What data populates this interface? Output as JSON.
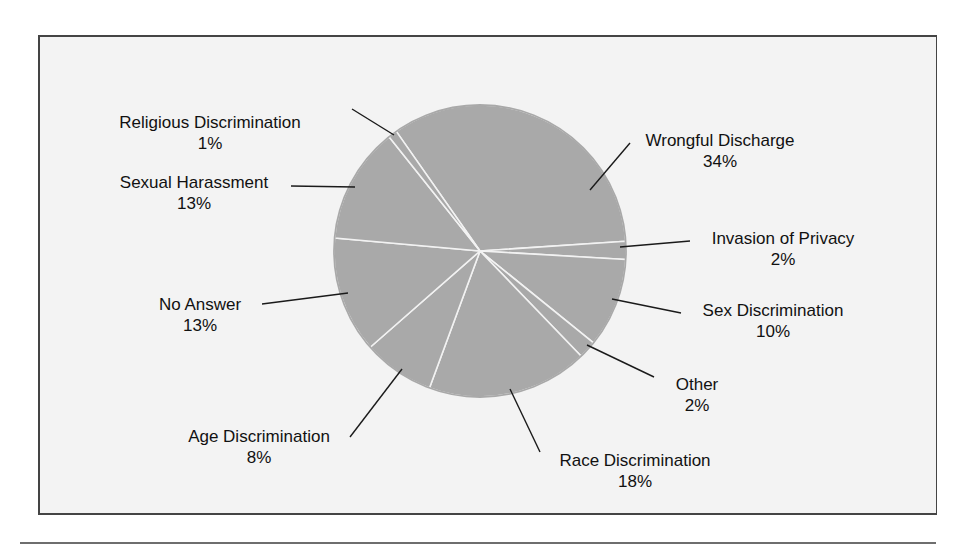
{
  "chart_data": {
    "type": "pie",
    "title": "",
    "categories": [
      "Wrongful Discharge",
      "Invasion of Privacy",
      "Sex Discrimination",
      "Other",
      "Race Discrimination",
      "Age Discrimination",
      "No Answer",
      "Sexual Harassment",
      "Religious Discrimination"
    ],
    "values": [
      34,
      2,
      10,
      2,
      18,
      8,
      13,
      13,
      1
    ],
    "value_labels": [
      "34%",
      "2%",
      "10%",
      "2%",
      "18%",
      "8%",
      "13%",
      "13%",
      "1%"
    ],
    "unit": "%",
    "slice_color": "#a9a9a9",
    "separator_color": "#f2f2f2",
    "start_angle_deg": -125,
    "direction": "clockwise",
    "legend": "none (callout labels with leader lines)"
  },
  "labels": {
    "wrongful": {
      "name": "Wrongful Discharge",
      "pct": "34%"
    },
    "invasion": {
      "name": "Invasion of Privacy",
      "pct": "2%"
    },
    "sex": {
      "name": "Sex Discrimination",
      "pct": "10%"
    },
    "other": {
      "name": "Other",
      "pct": "2%"
    },
    "race": {
      "name": "Race Discrimination",
      "pct": "18%"
    },
    "age": {
      "name": "Age Discrimination",
      "pct": "8%"
    },
    "noanswer": {
      "name": "No Answer",
      "pct": "13%"
    },
    "harassment": {
      "name": "Sexual Harassment",
      "pct": "13%"
    },
    "religious": {
      "name": "Religious Discrimination",
      "pct": "1%"
    }
  }
}
